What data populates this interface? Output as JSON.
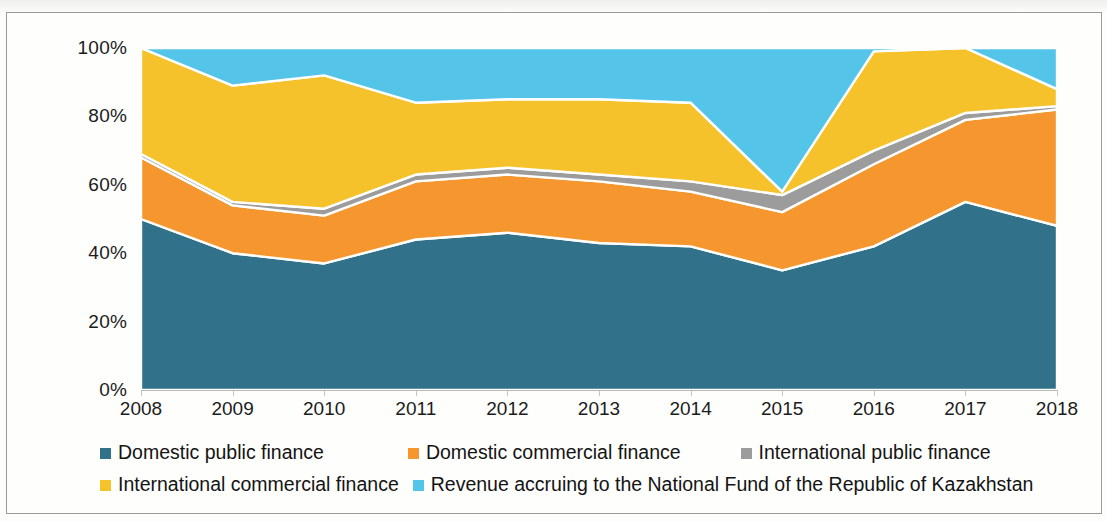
{
  "chart_data": {
    "type": "area",
    "stacked": true,
    "normalized_percent": true,
    "title": "",
    "subtitle": "",
    "xlabel": "",
    "ylabel": "",
    "grid": false,
    "legend_position": "bottom",
    "ylim": [
      0,
      100
    ],
    "y_ticks": [
      "0%",
      "20%",
      "40%",
      "60%",
      "80%",
      "100%"
    ],
    "y_tick_values": [
      0,
      20,
      40,
      60,
      80,
      100
    ],
    "categories": [
      "2008",
      "2009",
      "2010",
      "2011",
      "2012",
      "2013",
      "2014",
      "2015",
      "2016",
      "2017",
      "2018"
    ],
    "series": [
      {
        "name": "Domestic public finance",
        "color": "#31718a",
        "values": [
          50,
          40,
          37,
          44,
          46,
          43,
          42,
          35,
          42,
          55,
          48
        ]
      },
      {
        "name": "Domestic commercial finance",
        "color": "#f5962e",
        "values": [
          18,
          14,
          14,
          17,
          17,
          18,
          16,
          17,
          24,
          24,
          34
        ]
      },
      {
        "name": "International public finance",
        "color": "#9c9c9c",
        "values": [
          1,
          1,
          2,
          2,
          2,
          2,
          3,
          5,
          4,
          2,
          1
        ]
      },
      {
        "name": "International commercial finance",
        "color": "#f5c22b",
        "values": [
          31,
          34,
          39,
          21,
          20,
          22,
          23,
          1,
          29,
          19,
          5
        ]
      },
      {
        "name": "Revenue accruing to the National Fund of the Republic of Kazakhstan",
        "color": "#54c4e8",
        "values": [
          0,
          11,
          8,
          16,
          15,
          15,
          16,
          42,
          1,
          0,
          12
        ]
      }
    ]
  },
  "legend": {
    "items": [
      {
        "label": "Domestic public finance",
        "color": "#31718a"
      },
      {
        "label": "Domestic commercial finance",
        "color": "#f5962e"
      },
      {
        "label": "International public finance",
        "color": "#9c9c9c"
      },
      {
        "label": "International commercial finance",
        "color": "#f5c22b"
      },
      {
        "label": "Revenue accruing to the National Fund of the Republic of Kazakhstan",
        "color": "#54c4e8"
      }
    ]
  }
}
